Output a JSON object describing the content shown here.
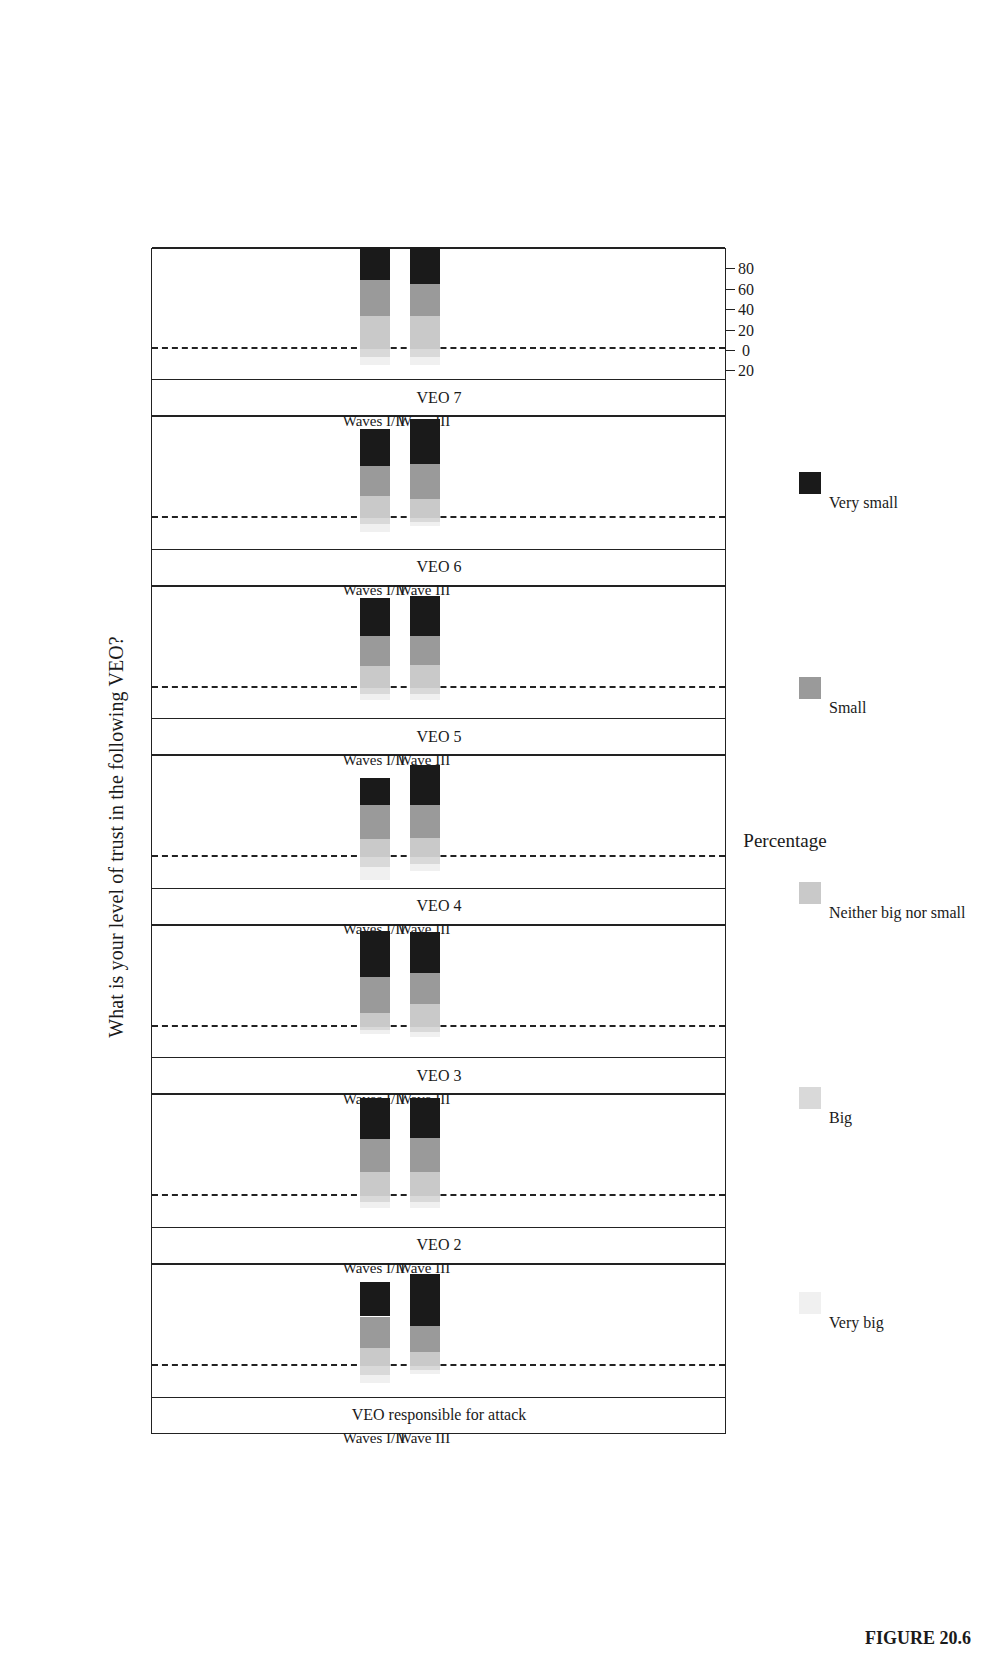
{
  "figure": {
    "caption": "FIGURE 20.6",
    "title": "What is your level of trust in the following VEO?"
  },
  "axis": {
    "label": "Percentage",
    "ticks": [
      "20",
      "0",
      "20",
      "40",
      "60",
      "80"
    ],
    "tick_values": [
      -20,
      0,
      20,
      40,
      60,
      80
    ],
    "range": [
      -26,
      95
    ]
  },
  "groups": [
    "Waves I/II",
    "Wave III"
  ],
  "legend": {
    "items": [
      {
        "label": "Very big",
        "color": "#f0f0f0"
      },
      {
        "label": "Big",
        "color": "#d9d9d9"
      },
      {
        "label": "Neither big nor small",
        "color": "#c9c9c9"
      },
      {
        "label": "Small",
        "color": "#9a9a9a"
      },
      {
        "label": "Very small",
        "color": "#1a1a1a"
      }
    ]
  },
  "chart_data": {
    "type": "bar",
    "subtype": "diverging-stacked-likert",
    "orientation": "horizontal",
    "title": "What is your level of trust in the following VEO?",
    "xlabel": "Percentage",
    "ylabel": "",
    "xlim": [
      -26,
      95
    ],
    "grid": false,
    "legend_position": "bottom",
    "categories": [
      "Waves I/II",
      "Wave III"
    ],
    "response_levels": [
      "Very big",
      "Big",
      "Neither big nor small",
      "Small",
      "Very small"
    ],
    "panels": [
      {
        "name": "VEO responsible for attack",
        "bars": [
          {
            "group": "Waves I/II",
            "very_big": 8.0,
            "big": 8.0,
            "neither": 18.0,
            "small": 31.0,
            "very_small": 34.0,
            "start": -16.0,
            "end": 84.0
          },
          {
            "group": "Wave III",
            "very_big": 4.0,
            "big": 3.0,
            "neither": 14.0,
            "small": 26.0,
            "very_small": 51.0,
            "start": -7.0,
            "end": 92.0
          }
        ]
      },
      {
        "name": "VEO 2",
        "bars": [
          {
            "group": "Waves I/II",
            "very_big": 6.0,
            "big": 6.0,
            "neither": 24.0,
            "small": 32.0,
            "very_small": 40.0,
            "start": -12.0,
            "end": 88.0
          },
          {
            "group": "Wave III",
            "very_big": 6.0,
            "big": 6.0,
            "neither": 24.0,
            "small": 33.0,
            "very_small": 39.0,
            "start": -12.0,
            "end": 87.0
          }
        ]
      },
      {
        "name": "VEO 3",
        "bars": [
          {
            "group": "Waves I/II",
            "very_big": 4.0,
            "big": 3.0,
            "neither": 13.0,
            "small": 36.0,
            "very_small": 45.0,
            "start": -7.0,
            "end": 91.0
          },
          {
            "group": "Wave III",
            "very_big": 5.0,
            "big": 5.0,
            "neither": 22.0,
            "small": 31.0,
            "very_small": 40.0,
            "start": -10.0,
            "end": 87.0
          }
        ]
      },
      {
        "name": "VEO 4",
        "bars": [
          {
            "group": "Waves I/II",
            "very_big": 12.0,
            "big": 10.0,
            "neither": 18.0,
            "small": 33.0,
            "very_small": 27.0,
            "start": -22.0,
            "end": 79.0
          },
          {
            "group": "Wave III",
            "very_big": 7.0,
            "big": 7.0,
            "neither": 19.0,
            "small": 32.0,
            "very_small": 39.0,
            "start": -14.0,
            "end": 85.0
          }
        ]
      },
      {
        "name": "VEO 5",
        "bars": [
          {
            "group": "Waves I/II",
            "very_big": 6.0,
            "big": 6.0,
            "neither": 21.0,
            "small": 30.0,
            "very_small": 37.0,
            "start": -12.0,
            "end": 87.0
          },
          {
            "group": "Wave III",
            "very_big": 6.0,
            "big": 6.0,
            "neither": 22.0,
            "small": 29.0,
            "very_small": 39.0,
            "start": -12.0,
            "end": 88.0
          }
        ]
      },
      {
        "name": "VEO 6",
        "bars": [
          {
            "group": "Waves I/II",
            "very_big": 7.0,
            "big": 6.0,
            "neither": 22.0,
            "small": 29.0,
            "very_small": 37.0,
            "start": -13.0,
            "end": 87.0
          },
          {
            "group": "Wave III",
            "very_big": 4.0,
            "big": 4.0,
            "neither": 19.0,
            "small": 34.0,
            "very_small": 44.0,
            "start": -8.0,
            "end": 90.0
          }
        ]
      },
      {
        "name": "VEO 7",
        "bars": [
          {
            "group": "Waves I/II",
            "very_big": 8.0,
            "big": 8.0,
            "neither": 32.0,
            "small": 36.0,
            "very_small": 32.0,
            "start": -16.0,
            "end": 84.0
          },
          {
            "group": "Wave III",
            "very_big": 8.0,
            "big": 8.0,
            "neither": 32.0,
            "small": 32.0,
            "very_small": 36.0,
            "start": -16.0,
            "end": 84.0
          }
        ]
      }
    ]
  }
}
